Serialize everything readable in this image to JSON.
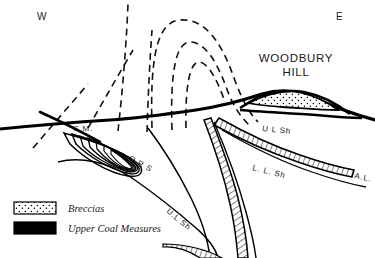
{
  "figure": {
    "type": "geological-cross-section",
    "title": "WOODBURY HILL",
    "title_line1": "WOODBURY",
    "title_line2": "HILL",
    "background_color": "#ffffff",
    "line_color": "#000000"
  },
  "orientation": {
    "west_label": "W",
    "east_label": "E"
  },
  "strata_labels": [
    {
      "id": "coal-measures",
      "text": "C.M.",
      "meaning": "Coal Measures"
    },
    {
      "id": "old-red-sandstone",
      "text": "O R S",
      "meaning": "Old Red Sandstone"
    },
    {
      "id": "upper-ludlow-shale-core",
      "text": "U.L Sh",
      "meaning": "Upper Ludlow Shale"
    },
    {
      "id": "upper-ludlow-shale-east",
      "text": "U L Sh",
      "meaning": "Upper Ludlow Shale"
    },
    {
      "id": "lower-ludlow-shale",
      "text": "L. L. Sh",
      "meaning": "Lower Ludlow Shale"
    },
    {
      "id": "aymestry-limestone",
      "text": "A.L.",
      "meaning": "Aymestry Limestone"
    }
  ],
  "legend": {
    "items": [
      {
        "swatch": "stipple",
        "label": "Breccias"
      },
      {
        "swatch": "solid-black",
        "label": "Upper Coal Measures"
      }
    ]
  }
}
